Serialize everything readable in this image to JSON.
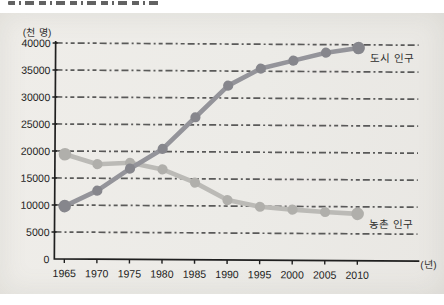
{
  "page": {
    "kind": "scanned textbook line chart",
    "background_color": "#ecebe7"
  },
  "chart_data": {
    "type": "line",
    "title": "",
    "xlabel": "(년)",
    "ylabel": "(천 명)",
    "categories": [
      1965,
      1970,
      1975,
      1980,
      1985,
      1990,
      1995,
      2000,
      2005,
      2010
    ],
    "series": [
      {
        "key": "urban",
        "name": "도시 인구",
        "values": [
          9800,
          12700,
          16800,
          20500,
          26400,
          32300,
          35500,
          37000,
          38500,
          39400
        ],
        "color_line": "#94949a",
        "color_dot": "#86868c"
      },
      {
        "key": "rural",
        "name": "농촌 인구",
        "values": [
          19400,
          17600,
          17900,
          16700,
          14300,
          11100,
          9900,
          9400,
          9000,
          8700
        ],
        "color_line": "#bbbab6",
        "color_dot": "#b0afab"
      }
    ],
    "ylim": [
      0,
      40000
    ],
    "y_tick_step": 5000,
    "y_tick_values": [
      0,
      5000,
      10000,
      15000,
      20000,
      25000,
      30000,
      35000,
      40000
    ],
    "grid": "horizontal-dashed",
    "grid_color": "#3a3a3a",
    "axis_color": "#1f1f1f",
    "legend_position": "labels-at-line-ends"
  }
}
